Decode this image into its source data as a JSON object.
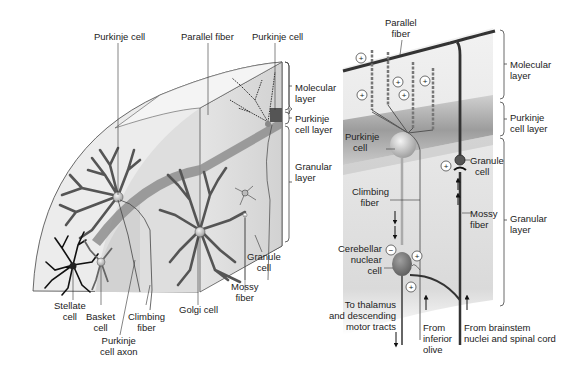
{
  "left_panel": {
    "labels": {
      "purkinje_cell_a": "Purkinje cell",
      "parallel_fiber": "Parallel fiber",
      "purkinje_cell_b": "Purkinje cell",
      "molecular_layer": [
        "Molecular",
        "layer"
      ],
      "purkinje_cell_layer": [
        "Purkinje",
        "cell layer"
      ],
      "granular_layer": [
        "Granular",
        "layer"
      ],
      "granule_cell": [
        "Granule",
        "cell"
      ],
      "mossy_fiber": [
        "Mossy",
        "fiber"
      ],
      "golgi_cell": "Golgi cell",
      "stellate_cell": [
        "Stellate",
        "cell"
      ],
      "basket_cell": [
        "Basket",
        "cell"
      ],
      "climbing_fiber": [
        "Climbing",
        "fiber"
      ],
      "purkinje_cell_axon": [
        "Purkinje",
        "cell axon"
      ]
    }
  },
  "right_panel": {
    "labels": {
      "parallel_fiber": [
        "Parallel",
        "fiber"
      ],
      "molecular_layer": [
        "Molecular",
        "layer"
      ],
      "purkinje_cell_layer": [
        "Purkinje",
        "cell layer"
      ],
      "granular_layer": [
        "Granular",
        "layer"
      ],
      "purkinje_cell": [
        "Purkinje",
        "cell"
      ],
      "granule_cell": [
        "Granule",
        "cell"
      ],
      "climbing_fiber": [
        "Climbing",
        "fiber"
      ],
      "mossy_fiber": [
        "Mossy",
        "fiber"
      ],
      "cerebellar_nuclear_cell": [
        "Cerebellar",
        "nuclear",
        "cell"
      ],
      "to_thalamus": [
        "To thalamus",
        "and descending",
        "motor tracts"
      ],
      "from_inferior_olive": [
        "From",
        "inferior",
        "olive"
      ],
      "from_brainstem": [
        "From brainstem",
        "nuclei and spinal cord"
      ]
    },
    "synapse_signs": {
      "excitatory": "+",
      "inhibitory": "−"
    }
  },
  "colors": {
    "background": "#ffffff",
    "text": "#222222",
    "dendrite_dark": "#555555",
    "dendrite_black": "#111111",
    "fiber_band": "#8a8a8a",
    "panel_light": "#e6e6e6",
    "panel_mid": "#cfcfcf",
    "purkinje_layer_band": "#9a9a9a"
  }
}
